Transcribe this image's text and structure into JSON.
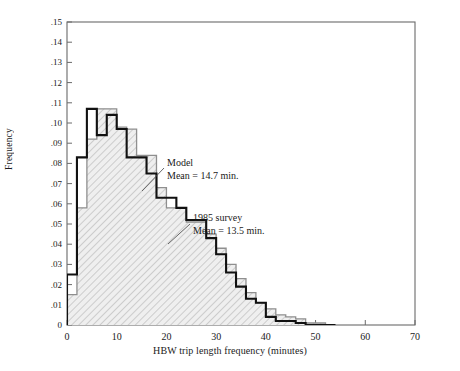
{
  "chart_data": {
    "type": "bar",
    "title": "",
    "xlabel": "HBW trip length frequency (minutes)",
    "ylabel": "Frequency",
    "xlim": [
      0,
      70
    ],
    "ylim": [
      0,
      0.15
    ],
    "grid": false,
    "bin_width": 2,
    "x_ticks": [
      0,
      10,
      20,
      30,
      40,
      50,
      60,
      70
    ],
    "x_tick_labels": [
      "0",
      "10",
      "20",
      "30",
      "40",
      "50",
      "60",
      "70"
    ],
    "y_ticks": [
      0,
      0.01,
      0.02,
      0.03,
      0.04,
      0.05,
      0.06,
      0.07,
      0.08,
      0.09,
      0.1,
      0.11,
      0.12,
      0.13,
      0.14,
      0.15
    ],
    "y_tick_labels": [
      "0",
      ".01",
      ".02",
      ".03",
      ".04",
      ".05",
      ".06",
      ".07",
      ".08",
      ".09",
      ".10",
      ".11",
      ".12",
      ".13",
      ".14",
      ".15"
    ],
    "bin_starts": [
      0,
      2,
      4,
      6,
      8,
      10,
      12,
      14,
      16,
      18,
      20,
      22,
      24,
      26,
      28,
      30,
      32,
      34,
      36,
      38,
      40,
      42,
      44,
      46,
      48,
      50,
      52
    ],
    "series": [
      {
        "name": "Model",
        "style": "bold-outline",
        "mean": 14.7,
        "mean_label": "Mean = 14.7 min.",
        "values": [
          0.025,
          0.083,
          0.107,
          0.094,
          0.104,
          0.097,
          0.083,
          0.083,
          0.075,
          0.063,
          0.063,
          0.058,
          0.052,
          0.052,
          0.043,
          0.035,
          0.026,
          0.019,
          0.013,
          0.011,
          0.004,
          0.002,
          0.002,
          0.001,
          0.0,
          0.0,
          0.0
        ]
      },
      {
        "name": "1985 survey",
        "style": "hatched-fill",
        "mean": 13.5,
        "mean_label": "Mean = 13.5 min.",
        "values": [
          0.015,
          0.058,
          0.092,
          0.107,
          0.107,
          0.098,
          0.097,
          0.084,
          0.084,
          0.068,
          0.058,
          0.058,
          0.051,
          0.051,
          0.045,
          0.038,
          0.03,
          0.023,
          0.016,
          0.011,
          0.008,
          0.005,
          0.004,
          0.003,
          0.001,
          0.001,
          0.0
        ]
      }
    ],
    "annotations": [
      {
        "id": "model-annotation",
        "lines": [
          "Model",
          "Mean = 14.7 min."
        ],
        "text_x": 167,
        "text_y": 157,
        "leader_from": [
          164,
          168
        ],
        "leader_to": [
          142,
          191
        ]
      },
      {
        "id": "survey-annotation",
        "lines": [
          "1985 survey",
          "Mean = 13.5 min."
        ],
        "text_x": 193,
        "text_y": 212,
        "leader_from": [
          190,
          224
        ],
        "leader_to": [
          168,
          244
        ]
      }
    ]
  },
  "colors": {
    "model_stroke": "#1a1a1a",
    "survey_stroke": "#8c8c8c",
    "survey_fill": "#e8e8e8",
    "hatch": "#b4b4b4",
    "axis": "#4a4a4a",
    "text": "#1a1a1a"
  }
}
